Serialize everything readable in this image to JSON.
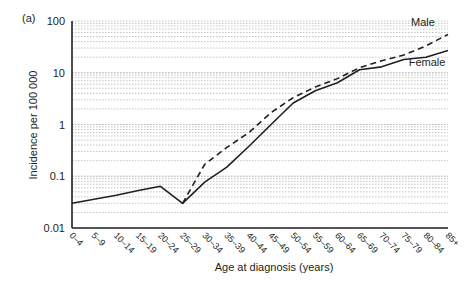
{
  "panel_label": "(a)",
  "chart_data": {
    "type": "line",
    "title": "",
    "xlabel": "Age at diagnosis (years)",
    "ylabel": "Incidence per 100 000",
    "yscale": "log",
    "ylim": [
      0.01,
      100
    ],
    "yticks": [
      0.01,
      0.1,
      1,
      10,
      100
    ],
    "ytick_labels": [
      "0.01",
      "0.1",
      "1",
      "10",
      "100"
    ],
    "grid": "horizontal dotted minor log gridlines",
    "legend": "inline labels",
    "categories": [
      "0–4",
      "5–9",
      "10–14",
      "15–19",
      "20–24",
      "25–29",
      "30–34",
      "35–39",
      "40–44",
      "45–49",
      "50–54",
      "55–59",
      "60–64",
      "65–69",
      "70–74",
      "75–79",
      "80–84",
      "85+"
    ],
    "series": [
      {
        "name": "Male",
        "style": "dashed",
        "values": [
          0.03,
          0.036,
          0.043,
          0.053,
          0.064,
          0.03,
          0.17,
          0.36,
          0.7,
          1.7,
          3.3,
          5.3,
          7.7,
          12.5,
          17,
          22,
          33,
          55
        ]
      },
      {
        "name": "Female",
        "style": "solid",
        "values": [
          0.03,
          0.036,
          0.043,
          0.053,
          0.064,
          0.03,
          0.077,
          0.15,
          0.38,
          1.0,
          2.6,
          4.5,
          6.4,
          11.4,
          13,
          18,
          20,
          27
        ]
      }
    ],
    "annotations": [
      {
        "text": "Male",
        "near": "85+ dashed line"
      },
      {
        "text": "Female",
        "near": "85+ solid line"
      }
    ]
  },
  "colors": {
    "line": "#231f20",
    "grid": "#b5b5b5"
  }
}
